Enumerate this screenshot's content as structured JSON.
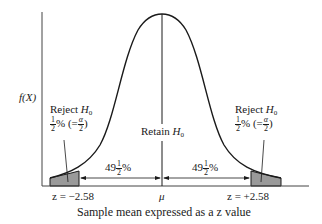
{
  "diagram": {
    "type": "normal-distribution-two-tailed-test",
    "y_axis_label": "f(X)",
    "x_axis_caption": "Sample mean expressed as a z value",
    "center_label": "μ",
    "retain_label": "Retain",
    "retain_subject": "H",
    "retain_subscript": "0",
    "left_tail": {
      "reject_label": "Reject",
      "reject_subject": "H",
      "reject_subscript": "0",
      "pct_num": "1",
      "pct_den": "2",
      "pct_sign": "%",
      "alpha_prefix": "(=",
      "alpha_num": "α",
      "alpha_den": "2",
      "alpha_suffix": ")",
      "z_label": "z = −2.58"
    },
    "right_tail": {
      "reject_label": "Reject",
      "reject_subject": "H",
      "reject_subscript": "0",
      "pct_num": "1",
      "pct_den": "2",
      "pct_sign": "%",
      "alpha_prefix": "(=",
      "alpha_num": "α",
      "alpha_den": "2",
      "alpha_suffix": ")",
      "z_label": "z = +2.58"
    },
    "left_middle": {
      "whole": "49",
      "num": "1",
      "den": "2",
      "sign": "%"
    },
    "right_middle": {
      "whole": "49",
      "num": "1",
      "den": "2",
      "sign": "%"
    },
    "colors": {
      "line": "#1a1a1a",
      "shade": "#9a9a9a",
      "background": "#ffffff"
    }
  }
}
